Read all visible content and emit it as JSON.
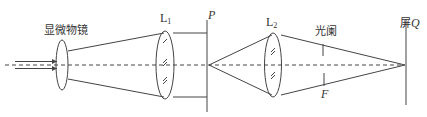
{
  "diagram": {
    "title": "",
    "labels": {
      "objective": "显微物镜",
      "lens1_main": "L",
      "lens1_sub": "1",
      "plane_p": "P",
      "lens2_main": "L",
      "lens2_sub": "2",
      "aperture": "光阑",
      "focus": "F",
      "screen_prefix": "屏",
      "screen_q": "Q"
    },
    "components": [
      {
        "id": "objective",
        "type": "lens",
        "label": "显微物镜"
      },
      {
        "id": "L1",
        "type": "lens",
        "label": "L1"
      },
      {
        "id": "P",
        "type": "plane",
        "label": "P"
      },
      {
        "id": "L2",
        "type": "lens",
        "label": "L2"
      },
      {
        "id": "aperture",
        "type": "stop",
        "label": "光阑",
        "position_label": "F"
      },
      {
        "id": "screen",
        "type": "screen",
        "label": "屏Q"
      }
    ],
    "colors": {
      "ink": "#444444",
      "background": "#ffffff"
    }
  }
}
